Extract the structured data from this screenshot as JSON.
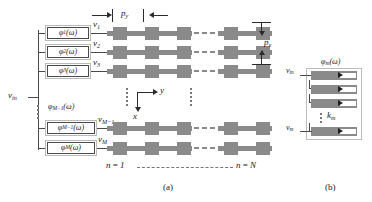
{
  "figure": {
    "caption_a": "(a)",
    "caption_b": "(b)"
  },
  "panel_a": {
    "input_label": "v",
    "input_sub": "in",
    "phase_shifters": [
      {
        "id": "ps-1",
        "fn": "φ",
        "sub": "1",
        "arg": "(ω)",
        "out": "v",
        "out_sub": "1"
      },
      {
        "id": "ps-2",
        "fn": "φ",
        "sub": "2",
        "arg": "(ω)",
        "out": "v",
        "out_sub": "2"
      },
      {
        "id": "ps-3",
        "fn": "φ",
        "sub": "3",
        "arg": "(ω)",
        "out": "v",
        "out_sub": "3"
      },
      {
        "id": "ps-m-1",
        "fn": "φ",
        "sub": "M−1",
        "arg": "(ω)",
        "out": "v",
        "out_sub": "M−1"
      },
      {
        "id": "ps-m",
        "fn": "φ",
        "sub": "M",
        "arg": "(ω)",
        "out": "v",
        "out_sub": "M"
      }
    ],
    "ellipsis_label": {
      "fn": "φ",
      "sub": "M−1",
      "arg": "(ω)"
    },
    "axes": {
      "y_label": "y",
      "x_label": "x"
    },
    "dim_py": {
      "label": "p",
      "sub": "y"
    },
    "dim_px": {
      "label": "p",
      "sub": "x"
    },
    "column_first": {
      "prefix": "n",
      "eq": "=",
      "value": "1"
    },
    "column_last": {
      "prefix": "n",
      "eq": "=",
      "value": "N"
    }
  },
  "panel_b": {
    "title": {
      "fn": "φ",
      "sub": "m",
      "arg": "(ω)"
    },
    "input_label": "v",
    "input_sub": "in",
    "output_label": "v",
    "output_sub": "m",
    "coupling_label": "k",
    "coupling_sub": "m",
    "bar_count": 4
  },
  "colors": {
    "element_gray": "#8a8a8a",
    "wire": "#4a4a4a",
    "frame_light": "#bdbdbd",
    "ink": "#1a1a1a",
    "background": "#ffffff"
  }
}
